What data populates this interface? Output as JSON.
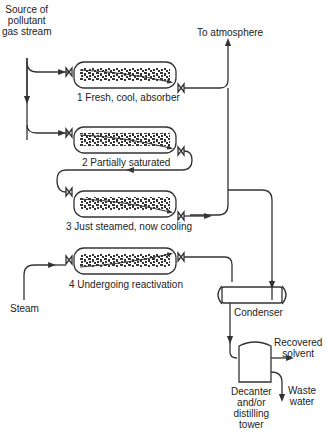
{
  "labels": {
    "source": [
      "Source of",
      "pollutant",
      "gas stream"
    ],
    "atmosphere": "To atmosphere",
    "steam": "Steam",
    "condenser": "Condenser",
    "recovered": [
      "Recovered",
      "solvent"
    ],
    "waste": [
      "Waste",
      "water"
    ],
    "decanter": [
      "Decanter",
      "and/or",
      "distilling",
      "tower"
    ]
  },
  "adsorbers": [
    {
      "number": "1",
      "caption": "1  Fresh, cool, absorber"
    },
    {
      "number": "2",
      "caption": "2  Partially saturated"
    },
    {
      "number": "3",
      "caption": "3  Just steamed, now cooling"
    },
    {
      "number": "4",
      "caption": "4  Undergoing reactivation"
    }
  ],
  "colors": {
    "line": "#333333",
    "background": "#ffffff"
  }
}
